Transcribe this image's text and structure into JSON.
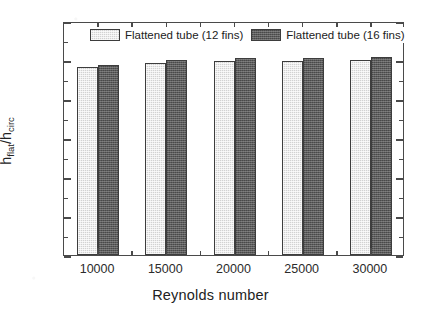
{
  "chart_data": {
    "type": "bar",
    "title": "",
    "xlabel": "Reynolds number",
    "ylabel": "h_flat/h_circ",
    "ylabel_parts": {
      "base1": "h",
      "sub1": "flat",
      "slash": "/",
      "base2": "h",
      "sub2": "circ"
    },
    "categories": [
      "10000",
      "15000",
      "20000",
      "25000",
      "30000"
    ],
    "series": [
      {
        "name": "Flattened tube (12 fins)",
        "color": "#d2d2d2",
        "values": [
          2.41,
          2.46,
          2.49,
          2.49,
          2.5
        ]
      },
      {
        "name": "Flattened tube (16 fins)",
        "color": "#5b5b5b",
        "values": [
          2.44,
          2.5,
          2.52,
          2.53,
          2.54
        ]
      }
    ],
    "ylim": [
      0.0,
      3.0
    ],
    "ytick_labels": [
      "0.0",
      "0.5",
      "1.0",
      "1.5",
      "2.0",
      "2.5",
      "3.0"
    ],
    "ytick_values": [
      0.0,
      0.5,
      1.0,
      1.5,
      2.0,
      2.5,
      3.0
    ],
    "y_minor_per_major": 2,
    "grid": false,
    "legend_position": "top-inside"
  },
  "legend": {
    "entries": [
      {
        "label": "Flattened tube (12 fins)",
        "swatch": "light-hatched-swatch"
      },
      {
        "label": "Flattened tube (16 fins)",
        "swatch": "dark-hatched-swatch"
      }
    ]
  },
  "colors": {
    "axis": "#4a4a4a",
    "text": "#222222",
    "series_light": "#d2d2d2",
    "series_dark": "#5b5b5b",
    "background": "#ffffff"
  }
}
